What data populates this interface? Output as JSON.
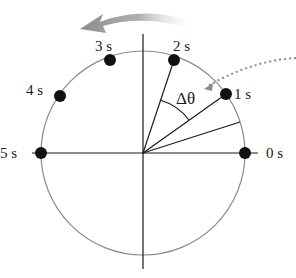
{
  "diagram": {
    "center": {
      "x": 143,
      "y": 153
    },
    "radius": 102,
    "colors": {
      "circle": "#8a8a8a",
      "axes": "#1a1a1a",
      "points": "#111111",
      "arrow": "#9a9a9a",
      "dotted_arrow": "#8a8a8a"
    },
    "points": [
      {
        "label": "0 s",
        "x": 245,
        "y": 153
      },
      {
        "label": "1 s",
        "x": 226,
        "y": 94
      },
      {
        "label": "2 s",
        "x": 174,
        "y": 60
      },
      {
        "label": "3 s",
        "x": 110,
        "y": 60
      },
      {
        "label": "4 s",
        "x": 60,
        "y": 96
      },
      {
        "label": "5 s",
        "x": 41,
        "y": 153
      }
    ],
    "angle_label": "Δθ",
    "rotation_direction": "counterclockwise"
  }
}
